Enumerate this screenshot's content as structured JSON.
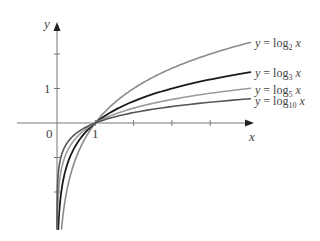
{
  "chart_data": {
    "type": "line",
    "title": "",
    "xlabel": "x",
    "ylabel": "y",
    "xlim": [
      -1.05,
      5.1
    ],
    "ylim": [
      -3.1,
      2.85
    ],
    "grid": false,
    "axis_labels": {
      "origin": "0",
      "x_tick_1": "1",
      "y_tick_1": "1"
    },
    "x_ticks": [
      1,
      2,
      3,
      4
    ],
    "y_ticks": [
      -2,
      -1,
      1,
      2
    ],
    "legend_position": "inline-right",
    "series": [
      {
        "name": "y = log₂ x",
        "base": 2,
        "color": "#8a8a8a",
        "width": 1.6,
        "x": [
          0.2,
          0.5,
          1,
          2,
          3,
          4,
          5
        ],
        "values": [
          -2.32,
          -1,
          0,
          1,
          1.58,
          2,
          2.32
        ]
      },
      {
        "name": "y = log₃ x",
        "base": 3,
        "color": "#1a1a1a",
        "width": 1.8,
        "x": [
          0.2,
          0.5,
          1,
          2,
          3,
          4,
          5
        ],
        "values": [
          -1.46,
          -0.63,
          0,
          0.63,
          1,
          1.26,
          1.46
        ]
      },
      {
        "name": "y = log₅ x",
        "base": 5,
        "color": "#9a9a9a",
        "width": 1.6,
        "x": [
          0.2,
          0.5,
          1,
          2,
          3,
          4,
          5
        ],
        "values": [
          -1,
          -0.43,
          0,
          0.43,
          0.68,
          0.86,
          1
        ]
      },
      {
        "name": "y = log₁₀ x",
        "base": 10,
        "color": "#555555",
        "width": 1.6,
        "x": [
          0.2,
          0.5,
          1,
          2,
          3,
          4,
          5
        ],
        "values": [
          -0.7,
          -0.3,
          0,
          0.3,
          0.48,
          0.6,
          0.7
        ]
      }
    ]
  },
  "labels": {
    "y_axis": "y",
    "x_axis": "x",
    "origin": "0",
    "x_one": "1",
    "y_one": "1",
    "legend": [
      {
        "prefix": "y = log",
        "sub": "2",
        "suffix": " x"
      },
      {
        "prefix": "y = log",
        "sub": "3",
        "suffix": " x"
      },
      {
        "prefix": "y = log",
        "sub": "5",
        "suffix": " x"
      },
      {
        "prefix": "y = log",
        "sub": "10",
        "suffix": " x"
      }
    ]
  }
}
